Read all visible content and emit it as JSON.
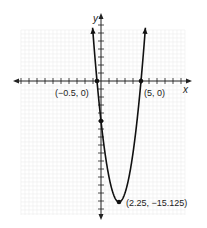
{
  "chart_data": {
    "type": "line",
    "title": "",
    "xlabel": "x",
    "ylabel": "y",
    "function": "y = 2(x + 0.5)(x - 5) = 2x^2 - 9x - 5",
    "xlim": [
      -11,
      11
    ],
    "ylim": [
      -17,
      10
    ],
    "grid": true,
    "tick_interval": 1,
    "points": [
      {
        "x": -0.5,
        "y": 0,
        "label": "(−0.5, 0)"
      },
      {
        "x": 5,
        "y": 0,
        "label": "(5, 0)"
      },
      {
        "x": 0,
        "y": -5,
        "label": ""
      },
      {
        "x": 2.25,
        "y": -15.125,
        "label": "(2.25, −15.125)"
      }
    ]
  },
  "labels": {
    "x_axis": "x",
    "y_axis": "y",
    "left_root": "(−0.5, 0)",
    "right_root": "(5, 0)",
    "vertex": "(2.25, −15.125)"
  },
  "colors": {
    "curve": "#111111",
    "axis": "#222222",
    "grid": "#ececec"
  }
}
